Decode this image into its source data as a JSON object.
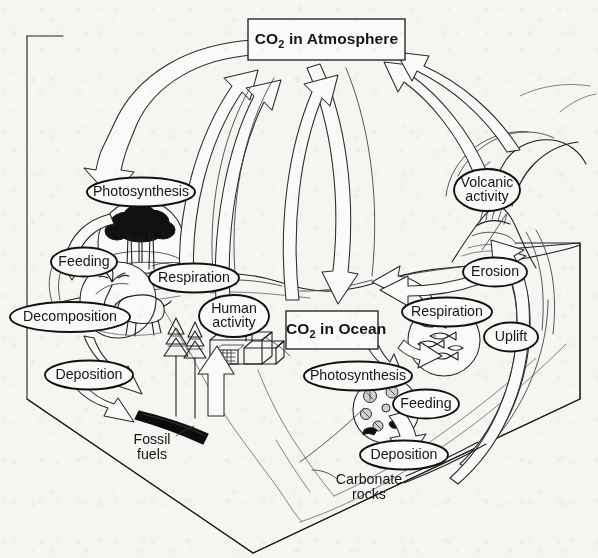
{
  "diagram": {
    "background_color": "#f6f5f2",
    "ink_color": "#1a1a1e"
  },
  "reservoirs": [
    {
      "id": "co2-atmosphere",
      "label_html": "CO2 in Atmosphere",
      "label_main": "CO",
      "label_sub": "2",
      "label_rest": " in Atmosphere",
      "x": 248,
      "y": 19,
      "w": 157,
      "h": 41
    },
    {
      "id": "co2-ocean",
      "label_html": "CO2 in Ocean",
      "label_main": "CO",
      "label_sub": "2",
      "label_rest": " in Ocean",
      "x": 286,
      "y": 311,
      "w": 92,
      "h": 38
    }
  ],
  "process_labels": [
    {
      "id": "photosynthesis-land",
      "text": "Photosynthesis",
      "cx": 141,
      "cy": 192,
      "rx": 54,
      "ry": 14.5,
      "lines": [
        "Photosynthesis"
      ]
    },
    {
      "id": "feeding-land",
      "text": "Feeding",
      "cx": 84,
      "cy": 262,
      "rx": 33,
      "ry": 14.5,
      "lines": [
        "Feeding"
      ]
    },
    {
      "id": "respiration-land",
      "text": "Respiration",
      "cx": 194,
      "cy": 278,
      "rx": 45,
      "ry": 14.5,
      "lines": [
        "Respiration"
      ]
    },
    {
      "id": "decomposition-land",
      "text": "Decomposition",
      "cx": 70,
      "cy": 317,
      "rx": 60,
      "ry": 15,
      "lines": [
        "Decomposition"
      ]
    },
    {
      "id": "deposition-land",
      "text": "Deposition",
      "cx": 89,
      "cy": 375,
      "rx": 44,
      "ry": 14.5,
      "lines": [
        "Deposition"
      ]
    },
    {
      "id": "human-activity",
      "text": "Human activity",
      "cx": 234,
      "cy": 316,
      "rx": 35,
      "ry": 21,
      "lines": [
        "Human",
        "activity"
      ]
    },
    {
      "id": "volcanic-activity",
      "text": "Volcanic activity",
      "cx": 487,
      "cy": 190,
      "rx": 33,
      "ry": 21,
      "lines": [
        "Volcanic",
        "activity"
      ]
    },
    {
      "id": "erosion",
      "text": "Erosion",
      "cx": 495,
      "cy": 272,
      "rx": 32,
      "ry": 14.5,
      "lines": [
        "Erosion"
      ]
    },
    {
      "id": "respiration-ocean",
      "text": "Respiration",
      "cx": 447,
      "cy": 312,
      "rx": 45,
      "ry": 14.5,
      "lines": [
        "Respiration"
      ]
    },
    {
      "id": "uplift",
      "text": "Uplift",
      "cx": 511,
      "cy": 337,
      "rx": 27,
      "ry": 14.5,
      "lines": [
        "Uplift"
      ]
    },
    {
      "id": "photosynthesis-ocean",
      "text": "Photosynthesis",
      "cx": 358,
      "cy": 376,
      "rx": 54,
      "ry": 14.5,
      "lines": [
        "Photosynthesis"
      ]
    },
    {
      "id": "feeding-ocean",
      "text": "Feeding",
      "cx": 426,
      "cy": 404,
      "rx": 33,
      "ry": 14.5,
      "lines": [
        "Feeding"
      ]
    },
    {
      "id": "deposition-ocean",
      "text": "Deposition",
      "cx": 404,
      "cy": 455,
      "rx": 44,
      "ry": 14.5,
      "lines": [
        "Deposition"
      ]
    }
  ],
  "plain_labels": [
    {
      "id": "fossil-fuels",
      "lines": [
        "Fossil",
        "fuels"
      ],
      "cx": 152,
      "cy": 447
    },
    {
      "id": "carbonate-rocks",
      "lines": [
        "Carbonate",
        "rocks"
      ],
      "cx": 369,
      "cy": 487
    }
  ],
  "scene_elements": [
    {
      "id": "land-block-3d",
      "name": "land block 3d frame"
    },
    {
      "id": "forest-circle",
      "name": "forest / trees inset"
    },
    {
      "id": "deer-circle",
      "name": "deer grazing inset"
    },
    {
      "id": "factory",
      "name": "factory with smokestack"
    },
    {
      "id": "conifer-trees",
      "name": "conifer trees"
    },
    {
      "id": "fossil-fuel-seam",
      "name": "black fossil fuel seam"
    },
    {
      "id": "volcano",
      "name": "erupting volcano with plume"
    },
    {
      "id": "fish-circle",
      "name": "fish shoal inset"
    },
    {
      "id": "plankton-circle",
      "name": "plankton / shells inset"
    },
    {
      "id": "ground-line",
      "name": "land surface contour"
    },
    {
      "id": "sea-floor",
      "name": "sea floor contour"
    }
  ],
  "flow_arrows": [
    {
      "id": "arrow-atm-to-photosynthesis-land",
      "from": "co2-atmosphere",
      "to": "photosynthesis-land"
    },
    {
      "id": "arrow-respiration-land-to-atm",
      "from": "respiration-land",
      "to": "co2-atmosphere"
    },
    {
      "id": "arrow-human-activity-to-atm",
      "from": "human-activity",
      "to": "co2-atmosphere"
    },
    {
      "id": "arrow-atm-to-ocean",
      "from": "co2-atmosphere",
      "to": "co2-ocean"
    },
    {
      "id": "arrow-ocean-to-atm",
      "from": "co2-ocean",
      "to": "co2-atmosphere"
    },
    {
      "id": "arrow-volcanic-to-atm",
      "from": "volcanic-activity",
      "to": "co2-atmosphere"
    },
    {
      "id": "arrow-ocean-to-photosynthesis",
      "from": "co2-ocean",
      "to": "photosynthesis-ocean"
    },
    {
      "id": "arrow-respiration-ocean-to-ocean",
      "from": "respiration-ocean",
      "to": "co2-ocean"
    },
    {
      "id": "arrow-feeding-ocean",
      "from": "photosynthesis-ocean",
      "to": "feeding-ocean"
    },
    {
      "id": "arrow-deposition-ocean",
      "from": "plankton-circle",
      "to": "carbonate-rocks"
    },
    {
      "id": "arrow-uplift",
      "from": "carbonate-rocks",
      "to": "erosion"
    },
    {
      "id": "arrow-deposition-land",
      "from": "decomposition-land",
      "to": "fossil-fuels"
    },
    {
      "id": "arrow-fossil-to-human",
      "from": "fossil-fuels",
      "to": "human-activity"
    },
    {
      "id": "arrow-feeding-land",
      "from": "forest-circle",
      "to": "deer-circle"
    }
  ]
}
